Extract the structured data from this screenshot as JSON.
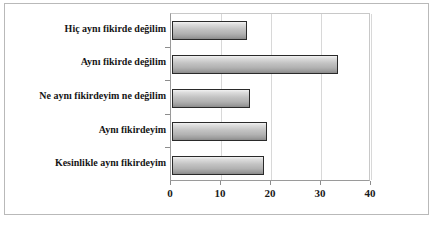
{
  "chart_data": {
    "type": "bar",
    "orientation": "horizontal",
    "title": "",
    "subtitle": "",
    "xlabel": "",
    "ylabel": "",
    "categories": [
      "Kesinlikle aynı fikirdeyim",
      "Aynı fikirdeyim",
      "Ne aynı fikirdeyim ne değilim",
      "Aynı fikirde değilim",
      "Hiç aynı fikirde değilim"
    ],
    "values": [
      18.3,
      19.0,
      15.6,
      33.2,
      15.0
    ],
    "xlim": [
      0,
      40
    ],
    "xticks": [
      0,
      10,
      20,
      30,
      40
    ],
    "xticklabels": [
      "0",
      "10",
      "20",
      "30",
      "40"
    ],
    "grid": true,
    "grid_axis": "x",
    "legend": false,
    "legend_position": "none",
    "series": [
      {
        "name": "",
        "values": [
          18.3,
          19.0,
          15.6,
          33.2,
          15.0
        ]
      }
    ],
    "bar_fill_color": "#c0c0c0",
    "bar_edge_color": "#2a2a2a",
    "plot_border_color": "#9a9a9a",
    "grid_color": "#d8d8d8",
    "text_color": "#161616"
  },
  "caption": ""
}
